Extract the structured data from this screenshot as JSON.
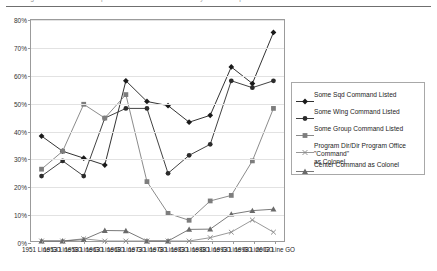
{
  "page": {
    "top_caption": "Figure — Command Experience of General Officers by Year Group"
  },
  "chart_data": {
    "type": "line",
    "title": "",
    "xlabel": "",
    "ylabel": "",
    "ylim": [
      0,
      80
    ],
    "ytick_values": [
      0,
      10,
      20,
      30,
      40,
      50,
      60,
      70,
      80
    ],
    "ytick_labels": [
      "0%",
      "10%",
      "20%",
      "30%",
      "40%",
      "50%",
      "60%",
      "70%",
      "80%"
    ],
    "grid": true,
    "legend_position": "right",
    "categories": [
      "1951\nLine\nGO",
      "1953\nLine\nGO",
      "1958\nLine\nGO",
      "1963\nLine\nGO",
      "1968\nLine\nGO",
      "1973\nLine\nGO",
      "1978\nLine\nGO",
      "1983\nLine\nGO",
      "1988\nLine\nGO",
      "1993\nLine\nGO",
      "1998\nLine\nGO",
      "2002\nLine\nGO"
    ],
    "series": [
      {
        "name": "Some Sqd Command Listed",
        "marker": "diamond",
        "color": "#1a1a1a",
        "values": [
          38.0,
          32.5,
          30.0,
          27.5,
          58.0,
          50.5,
          49.0,
          43.0,
          45.5,
          63.0,
          57.0,
          75.5
        ]
      },
      {
        "name": "Some Wing Command Listed",
        "marker": "circle",
        "color": "#2b2b2b",
        "values": [
          23.5,
          29.0,
          23.5,
          44.5,
          48.0,
          48.0,
          24.5,
          31.0,
          35.0,
          58.0,
          55.5,
          58.0
        ]
      },
      {
        "name": "Some Group Command Listed",
        "marker": "square",
        "color": "#7d7d7d",
        "values": [
          26.0,
          32.5,
          49.5,
          44.5,
          53.0,
          21.5,
          10.0,
          7.5,
          14.5,
          16.5,
          29.0,
          48.0
        ]
      },
      {
        "name": "Program Dir/Dir Program Office \"Command\"\nas Colonel",
        "marker": "cross",
        "color": "#8c8c8c",
        "values": [
          0.0,
          0.0,
          0.8,
          0.0,
          0.0,
          0.0,
          0.0,
          0.0,
          1.2,
          3.2,
          7.6,
          3.2
        ]
      },
      {
        "name": "Center Command as Colonel",
        "marker": "triangle",
        "color": "#6a6a6a",
        "values": [
          0.0,
          0.0,
          0.5,
          3.8,
          3.7,
          0.0,
          0.0,
          4.2,
          4.3,
          9.7,
          11.0,
          11.5
        ]
      }
    ]
  }
}
